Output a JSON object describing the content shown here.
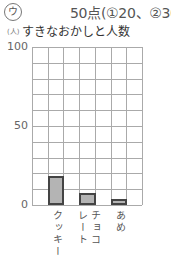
{
  "header": {
    "marker": "ウ",
    "score": "50点(①20、②30)",
    "unit": "(人)",
    "title": "すきなおかしと人数"
  },
  "axis": {
    "ticks": [
      {
        "label": "100",
        "value": 100
      },
      {
        "label": "50",
        "value": 50
      },
      {
        "label": "0",
        "value": 0
      }
    ]
  },
  "labels": {
    "cookie": "クッキー",
    "choco_1": "チョコ",
    "choco_2": "レート",
    "candy": "あめ"
  },
  "colors": {
    "bar_fill": "#b4b4b4",
    "bar_border": "#444444",
    "grid": "#aaaaaa"
  },
  "chart_data": {
    "type": "bar",
    "title": "すきなおかしと人数",
    "xlabel": "",
    "ylabel": "(人)",
    "categories": [
      "クッキー",
      "チョコレート",
      "あめ"
    ],
    "values": [
      18,
      7,
      3
    ],
    "ylim": [
      0,
      100
    ],
    "yticks": [
      0,
      50,
      100
    ],
    "grid": true,
    "grid_rows": 10,
    "grid_cols": 7,
    "legend": null
  }
}
